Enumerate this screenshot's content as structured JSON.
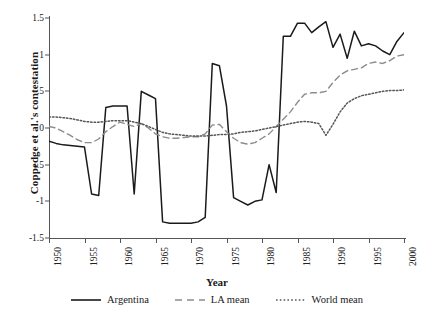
{
  "chart_data": {
    "type": "line",
    "title": "",
    "xlabel": "Year",
    "ylabel": "Coppedge et al.'s contestation",
    "xlim": [
      1950,
      2000
    ],
    "ylim": [
      -1.5,
      1.5
    ],
    "grid": false,
    "legend_position": "bottom",
    "xticks": [
      "1950",
      "1955",
      "1960",
      "1965",
      "1970",
      "1975",
      "1980",
      "1985",
      "1990",
      "1995",
      "2000"
    ],
    "xtick_values": [
      1950,
      1955,
      1960,
      1965,
      1970,
      1975,
      1980,
      1985,
      1990,
      1995,
      2000
    ],
    "yticks": [
      "1.5",
      "1",
      ".5",
      "0",
      "-.5",
      "-1",
      "-1.5"
    ],
    "ytick_values": [
      1.5,
      1,
      0.5,
      0,
      -0.5,
      -1,
      -1.5
    ],
    "x": [
      1950,
      1951,
      1952,
      1953,
      1954,
      1955,
      1956,
      1957,
      1958,
      1959,
      1960,
      1961,
      1962,
      1963,
      1964,
      1965,
      1966,
      1967,
      1968,
      1969,
      1970,
      1971,
      1972,
      1973,
      1974,
      1975,
      1976,
      1977,
      1978,
      1979,
      1980,
      1981,
      1982,
      1983,
      1984,
      1985,
      1986,
      1987,
      1988,
      1989,
      1990,
      1991,
      1992,
      1993,
      1994,
      1995,
      1996,
      1997,
      1998,
      1999,
      2000
    ],
    "series": [
      {
        "name": "Argentina",
        "style": "solid",
        "color": "#1a1a1a",
        "values": [
          -0.18,
          -0.21,
          -0.23,
          -0.24,
          -0.25,
          -0.26,
          -0.9,
          -0.92,
          0.28,
          0.3,
          0.3,
          0.3,
          -0.9,
          0.5,
          0.45,
          0.4,
          -1.28,
          -1.3,
          -1.3,
          -1.3,
          -1.3,
          -1.28,
          -1.22,
          0.88,
          0.85,
          0.3,
          -0.95,
          -1.0,
          -1.05,
          -1.0,
          -0.98,
          -0.5,
          -0.88,
          1.25,
          1.25,
          1.43,
          1.43,
          1.3,
          1.38,
          1.45,
          1.1,
          1.28,
          0.95,
          1.32,
          1.12,
          1.15,
          1.12,
          1.05,
          1.0,
          1.18,
          1.3
        ]
      },
      {
        "name": "LA mean",
        "style": "dashed",
        "color": "#8c8c8c",
        "values": [
          0.02,
          0.0,
          -0.05,
          -0.1,
          -0.16,
          -0.2,
          -0.2,
          -0.15,
          -0.05,
          0.02,
          0.08,
          0.05,
          0.02,
          0.06,
          0.0,
          -0.08,
          -0.12,
          -0.14,
          -0.14,
          -0.13,
          -0.12,
          -0.12,
          -0.08,
          0.04,
          0.05,
          -0.05,
          -0.14,
          -0.2,
          -0.22,
          -0.2,
          -0.14,
          -0.08,
          0.02,
          0.12,
          0.22,
          0.35,
          0.46,
          0.48,
          0.48,
          0.5,
          0.62,
          0.72,
          0.78,
          0.8,
          0.82,
          0.88,
          0.9,
          0.88,
          0.92,
          0.98,
          1.0
        ]
      },
      {
        "name": "World mean",
        "style": "dotted",
        "color": "#555555",
        "values": [
          0.15,
          0.15,
          0.14,
          0.13,
          0.11,
          0.09,
          0.08,
          0.08,
          0.09,
          0.1,
          0.1,
          0.1,
          0.08,
          0.06,
          0.02,
          -0.02,
          -0.06,
          -0.08,
          -0.09,
          -0.1,
          -0.11,
          -0.11,
          -0.11,
          -0.1,
          -0.09,
          -0.09,
          -0.08,
          -0.06,
          -0.05,
          -0.04,
          -0.02,
          0.0,
          0.02,
          0.04,
          0.06,
          0.08,
          0.09,
          0.08,
          0.06,
          -0.1,
          0.05,
          0.22,
          0.34,
          0.4,
          0.44,
          0.46,
          0.48,
          0.5,
          0.51,
          0.51,
          0.52
        ]
      }
    ]
  },
  "legend": {
    "items": [
      {
        "label": "Argentina"
      },
      {
        "label": "LA mean"
      },
      {
        "label": "World mean"
      }
    ]
  }
}
